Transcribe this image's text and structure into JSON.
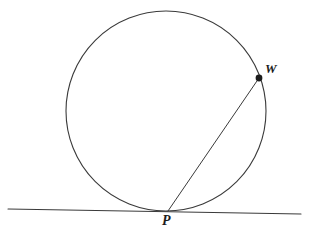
{
  "figure": {
    "background_color": "#ffffff",
    "stroke_color": "#3a3a3a",
    "label_color": "#1c1c1c",
    "width": 309,
    "height": 240
  },
  "labels": {
    "point_w": "W",
    "point_p": "P"
  },
  "shapes": {
    "circle": {
      "name": "circle",
      "cx": 166,
      "cy": 111,
      "r": 100,
      "stroke": "#3a3a3a",
      "stroke_width": 1.1,
      "fill": "none"
    },
    "tangent_line": {
      "name": "tangent-line",
      "x1": 8,
      "y1": 209,
      "x2": 301,
      "y2": 214,
      "stroke": "#3a3a3a",
      "stroke_width": 1.1
    },
    "chord": {
      "name": "chord-p-w",
      "x1": 168,
      "y1": 211,
      "x2": 259,
      "y2": 78,
      "stroke": "#3a3a3a",
      "stroke_width": 1.0
    },
    "point_w_dot": {
      "name": "point-w-marker",
      "cx": 259,
      "cy": 78,
      "r": 3.4,
      "fill": "#1c1c1c"
    },
    "point_p_dot": {
      "name": "point-p-marker",
      "cx": 168,
      "cy": 211,
      "r": 0,
      "fill": "#1c1c1c"
    }
  }
}
